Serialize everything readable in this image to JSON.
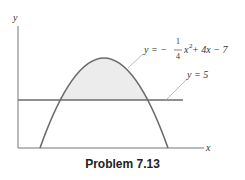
{
  "diagram": {
    "axes": {
      "x_label": "x",
      "y_label": "y"
    },
    "curve_label": {
      "lhs": "y = −",
      "frac_num": "1",
      "frac_den": "4",
      "rest_x": "x",
      "exp": "2",
      "tail": " + 4x − 7"
    },
    "line_label": "y = 5",
    "caption": "Problem 7.13",
    "colors": {
      "curve": "#6b6b6b",
      "shade": "#ececec",
      "axis": "#777777"
    }
  }
}
